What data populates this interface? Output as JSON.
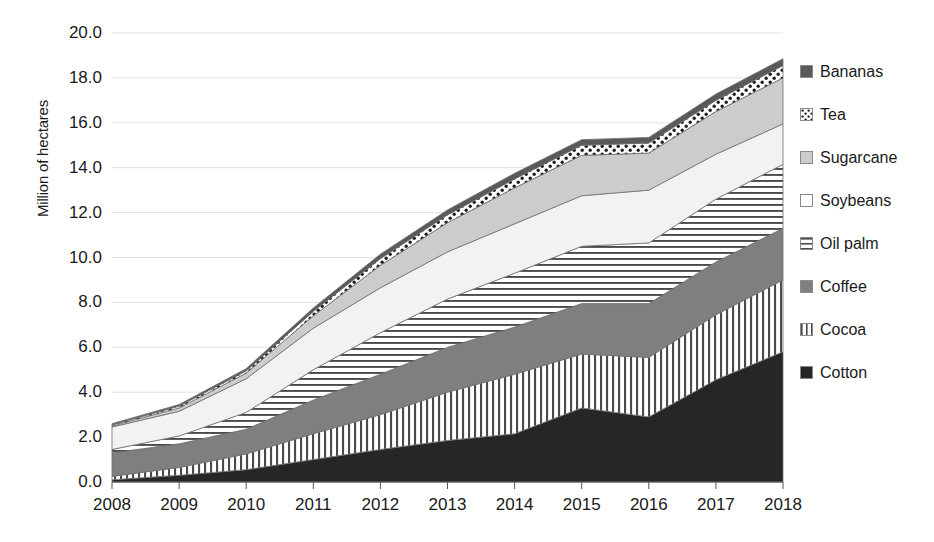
{
  "chart_data": {
    "type": "area",
    "title": "",
    "xlabel": "",
    "ylabel": "Million of hectares",
    "categories": [
      "2008",
      "2009",
      "2010",
      "2011",
      "2012",
      "2013",
      "2014",
      "2015",
      "2016",
      "2017",
      "2018"
    ],
    "ylim": [
      0,
      20
    ],
    "ytick_step": 2,
    "ytick_labels": [
      "20.0",
      "18.0",
      "16.0",
      "14.0",
      "12.0",
      "10.0",
      "8.0",
      "6.0",
      "4.0",
      "2.0",
      "0.0"
    ],
    "grid": true,
    "stacked": true,
    "legend_position": "right",
    "series": [
      {
        "name": "Cotton",
        "order": 1,
        "fill": "#262626",
        "pattern": "solid-dark",
        "values": [
          0.1,
          0.3,
          0.55,
          1.0,
          1.45,
          1.85,
          2.15,
          3.3,
          2.9,
          4.55,
          5.8
        ]
      },
      {
        "name": "Cocoa",
        "order": 2,
        "fill": "#ffffff",
        "pattern": "vertical-lines",
        "values": [
          0.15,
          0.35,
          0.7,
          1.15,
          1.55,
          2.15,
          2.65,
          2.4,
          2.65,
          2.9,
          3.2
        ]
      },
      {
        "name": "Coffee",
        "order": 3,
        "fill": "#7f7f7f",
        "pattern": "solid-mid",
        "values": [
          1.05,
          1.05,
          1.1,
          1.5,
          1.8,
          2.0,
          2.1,
          2.25,
          2.4,
          2.35,
          2.3
        ]
      },
      {
        "name": "Oil palm",
        "order": 4,
        "fill": "#ffffff",
        "pattern": "horizontal-lines",
        "values": [
          0.15,
          0.35,
          0.75,
          1.35,
          1.85,
          2.15,
          2.4,
          2.55,
          2.7,
          2.8,
          2.85
        ]
      },
      {
        "name": "Soybeans",
        "order": 5,
        "fill": "#f2f2f2",
        "pattern": "solid-light",
        "values": [
          1.0,
          1.1,
          1.5,
          1.85,
          2.0,
          2.1,
          2.2,
          2.25,
          2.35,
          2.0,
          1.8
        ]
      },
      {
        "name": "Sugarcane",
        "order": 6,
        "fill": "#cccccc",
        "pattern": "solid-lightgray",
        "values": [
          0.05,
          0.15,
          0.25,
          0.55,
          1.0,
          1.3,
          1.6,
          1.8,
          1.65,
          1.9,
          2.05
        ]
      },
      {
        "name": "Tea",
        "order": 7,
        "fill": "#ffffff",
        "pattern": "dots",
        "values": [
          0.05,
          0.08,
          0.1,
          0.2,
          0.3,
          0.35,
          0.4,
          0.45,
          0.45,
          0.5,
          0.55
        ]
      },
      {
        "name": "Bananas",
        "order": 8,
        "fill": "#595959",
        "pattern": "solid-darkgray",
        "values": [
          0.05,
          0.07,
          0.1,
          0.15,
          0.2,
          0.22,
          0.25,
          0.25,
          0.25,
          0.28,
          0.3
        ]
      }
    ],
    "totals": [
      2.6,
      3.45,
      5.05,
      7.75,
      10.15,
      12.12,
      13.75,
      15.25,
      15.35,
      17.28,
      18.85
    ]
  },
  "legend": {
    "items": [
      {
        "label": "Bananas",
        "swatch": "solid-darkgray"
      },
      {
        "label": "Tea",
        "swatch": "dots"
      },
      {
        "label": "Sugarcane",
        "swatch": "solid-lightgray"
      },
      {
        "label": "Soybeans",
        "swatch": "solid-white"
      },
      {
        "label": "Oil palm",
        "swatch": "horizontal-lines"
      },
      {
        "label": "Coffee",
        "swatch": "solid-mid"
      },
      {
        "label": "Cocoa",
        "swatch": "vertical-lines"
      },
      {
        "label": "Cotton",
        "swatch": "solid-dark"
      }
    ]
  }
}
